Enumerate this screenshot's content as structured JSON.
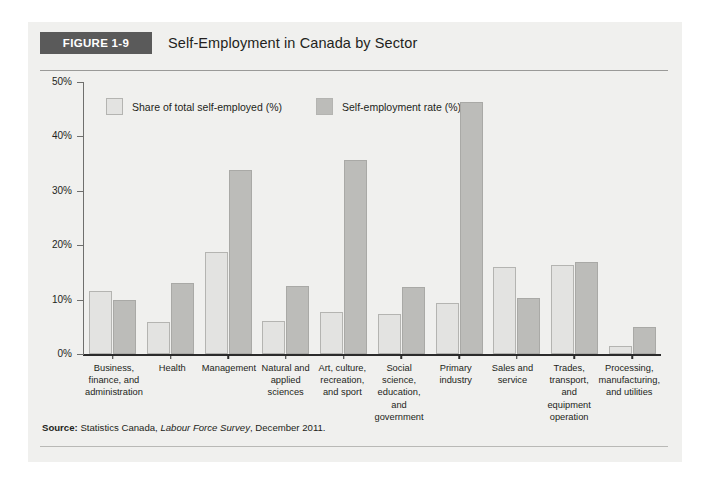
{
  "figure": {
    "badge": "FIGURE 1-9",
    "title": "Self-Employment in Canada by Sector",
    "source_prefix": "Source:",
    "source_text_1": " Statistics Canada, ",
    "source_italic": "Labour Force Survey",
    "source_text_2": ", December 2011."
  },
  "colors": {
    "badge_bg": "#5a5a5a",
    "series_a": "#e3e3e1",
    "series_b": "#bcbcb9",
    "panel_bg": "#f0f0ee",
    "axis": "#2b2b2b"
  },
  "chart_data": {
    "type": "bar",
    "title": "Self-Employment in Canada by Sector",
    "xlabel": "",
    "ylabel": "",
    "ylim": [
      0,
      50
    ],
    "yticks": [
      0,
      10,
      20,
      30,
      40,
      50
    ],
    "ytick_labels": [
      "0%",
      "10%",
      "20%",
      "30%",
      "40%",
      "50%"
    ],
    "grid": false,
    "legend_position": "top-left",
    "categories": [
      "Business, finance, and administration",
      "Health",
      "Management",
      "Natural and applied sciences",
      "Art, culture, recreation, and sport",
      "Social science, education, and government",
      "Primary industry",
      "Sales and service",
      "Trades, transport, and equipment operation",
      "Processing, manufacturing, and utilities"
    ],
    "series": [
      {
        "name": "Share of total self-employed (%)",
        "color": "#e3e3e1",
        "values": [
          11.5,
          5.8,
          18.8,
          6.0,
          7.8,
          7.3,
          9.3,
          16.0,
          16.4,
          1.5
        ]
      },
      {
        "name": "Self-employment rate (%)",
        "color": "#bcbcb9",
        "values": [
          9.9,
          13.0,
          33.8,
          12.5,
          35.6,
          12.3,
          46.3,
          10.3,
          17.0,
          5.0
        ]
      }
    ]
  }
}
